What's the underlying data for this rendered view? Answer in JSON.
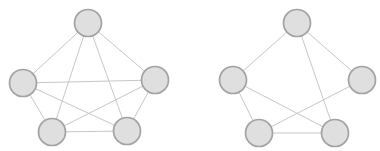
{
  "page": {
    "background_color": "#ffffff",
    "width": 380,
    "height": 151
  },
  "diagram": {
    "type": "node-link-graphs",
    "node_style": {
      "radius": 13.5,
      "fill": "#dfdfdf",
      "stroke": "#a2a2a2",
      "stroke_width": 1.7
    },
    "edge_style": {
      "stroke": "#c5c8c5",
      "stroke_width": 1
    },
    "graphs": [
      {
        "name": "left-graph-complete-k5",
        "node_count": 5,
        "edge_count": 10,
        "nodes": [
          {
            "id": "top",
            "x": 88,
            "y": 23
          },
          {
            "id": "left",
            "x": 23,
            "y": 83
          },
          {
            "id": "right",
            "x": 155,
            "y": 80
          },
          {
            "id": "bottom-left",
            "x": 52,
            "y": 132
          },
          {
            "id": "bottom-right",
            "x": 127,
            "y": 131
          }
        ],
        "edges": [
          [
            "top",
            "left"
          ],
          [
            "top",
            "right"
          ],
          [
            "top",
            "bottom-left"
          ],
          [
            "top",
            "bottom-right"
          ],
          [
            "left",
            "right"
          ],
          [
            "left",
            "bottom-left"
          ],
          [
            "left",
            "bottom-right"
          ],
          [
            "right",
            "bottom-left"
          ],
          [
            "right",
            "bottom-right"
          ],
          [
            "bottom-left",
            "bottom-right"
          ]
        ]
      },
      {
        "name": "right-graph-partial",
        "node_count": 5,
        "edge_count": 7,
        "nodes": [
          {
            "id": "top",
            "x": 297,
            "y": 23
          },
          {
            "id": "left",
            "x": 233,
            "y": 80
          },
          {
            "id": "right",
            "x": 362,
            "y": 80
          },
          {
            "id": "bottom-left",
            "x": 259,
            "y": 133
          },
          {
            "id": "bottom-right",
            "x": 335,
            "y": 133
          }
        ],
        "edges": [
          [
            "top",
            "left"
          ],
          [
            "top",
            "right"
          ],
          [
            "top",
            "bottom-right"
          ],
          [
            "left",
            "bottom-left"
          ],
          [
            "left",
            "bottom-right"
          ],
          [
            "right",
            "bottom-left"
          ],
          [
            "bottom-left",
            "bottom-right"
          ]
        ]
      }
    ]
  }
}
